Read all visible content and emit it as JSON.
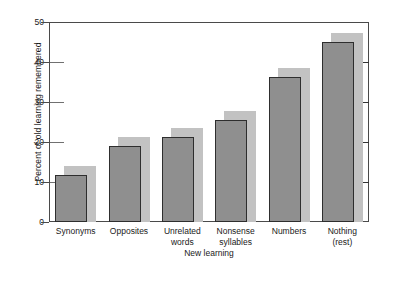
{
  "chart_data": {
    "type": "bar",
    "title": "",
    "xlabel": "New learning",
    "ylabel": "Percent of old learning remembered",
    "categories": [
      "Synonyms",
      "Opposites",
      "Unrelated\nwords",
      "Nonsense\nsyllables",
      "Numbers",
      "Nothing\n(rest)"
    ],
    "values": [
      11.8,
      19,
      21.2,
      25.5,
      36.2,
      45
    ],
    "ylim": [
      0,
      50
    ],
    "yticks": [
      0,
      10,
      20,
      30,
      40,
      50
    ],
    "ytick_labels": [
      "0",
      "10",
      "20",
      "30",
      "40",
      "50"
    ],
    "grid": "horizontal-stubs",
    "legend": "none",
    "colors": {
      "bar_face": "#8f8f8f",
      "bar_edge": "#2e2e2e",
      "bar_shadow": "#c2c2c2",
      "axis": "#4a4a4a",
      "gridline": "#707070",
      "text": "#1a1a1a",
      "background": "#ffffff"
    }
  }
}
